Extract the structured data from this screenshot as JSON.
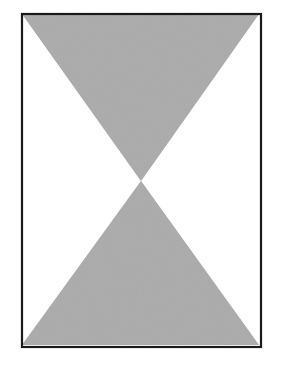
{
  "figure": {
    "canvas": {
      "width": 281,
      "height": 367,
      "background_color": "#ffffff"
    },
    "frame": {
      "name": "rectangular-border",
      "stroke_color": "#1a1a1a",
      "stroke_width": 2,
      "fill_color": "#ffffff",
      "left": 21,
      "top": 13,
      "right": 260,
      "bottom": 346
    },
    "center_point": {
      "x": 141,
      "y": 181
    },
    "shapes": [
      {
        "name": "upper-triangle",
        "fill_color": "#ababab",
        "orientation": "apex-down",
        "points": "22,14 259,14 141,181"
      },
      {
        "name": "lower-triangle",
        "fill_color": "#ababab",
        "orientation": "apex-up",
        "points": "141,181 259,345 22,345"
      }
    ],
    "negative_space": [
      {
        "name": "left-white-wedge",
        "fill_color": "#ffffff"
      },
      {
        "name": "right-white-wedge",
        "fill_color": "#ffffff"
      }
    ]
  }
}
